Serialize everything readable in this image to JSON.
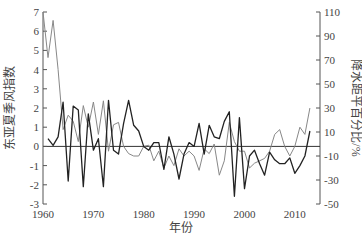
{
  "chart_data": {
    "type": "line",
    "title": "",
    "xlabel": "年份",
    "ylabel_left": "东亚夏季风指数",
    "ylabel_right": "降水距平百分比/%",
    "x_ticks": [
      "1960",
      "1970",
      "1980",
      "1990",
      "2000",
      "2010"
    ],
    "y_left_ticks": [
      "7",
      "6",
      "5",
      "4",
      "3",
      "2",
      "1",
      "0",
      "-1",
      "-2",
      "-3"
    ],
    "y_right_ticks": [
      "110",
      "90",
      "70",
      "50",
      "30",
      "10",
      "-10",
      "-30",
      "-50"
    ],
    "ylim_left": [
      -3,
      7
    ],
    "ylim_right": [
      -50,
      110
    ],
    "xlim": [
      1960,
      2015
    ],
    "grid": false,
    "legend": "none",
    "zero_line": true,
    "series": [
      {
        "name": "东亚夏季风指数",
        "axis": "left",
        "color": "#222222",
        "x": [
          1961,
          1962,
          1963,
          1964,
          1965,
          1966,
          1967,
          1968,
          1969,
          1970,
          1971,
          1972,
          1973,
          1974,
          1975,
          1976,
          1977,
          1978,
          1979,
          1980,
          1981,
          1982,
          1983,
          1984,
          1985,
          1986,
          1987,
          1988,
          1989,
          1990,
          1991,
          1992,
          1993,
          1994,
          1995,
          1996,
          1997,
          1998,
          1999,
          2000,
          2001,
          2002,
          2003,
          2004,
          2005,
          2006,
          2007,
          2008,
          2009,
          2010,
          2011,
          2012,
          2013
        ],
        "values": [
          0.4,
          0.05,
          0.5,
          2.3,
          -1.8,
          2.1,
          1.9,
          -2.1,
          1.7,
          -0.2,
          0.4,
          -2.1,
          2.4,
          -0.2,
          -0.4,
          1.2,
          2.4,
          1.1,
          0.8,
          0.0,
          -0.2,
          0.2,
          0.2,
          -1.2,
          0.5,
          -0.4,
          -1.7,
          -0.4,
          0.2,
          0.0,
          1.2,
          -0.4,
          1.1,
          0.5,
          0.4,
          1.3,
          1.8,
          -2.6,
          1.5,
          -2.2,
          -0.5,
          -0.2,
          -0.9,
          -1.5,
          -0.3,
          -0.7,
          -0.9,
          -0.9,
          -0.6,
          -1.4,
          -1.0,
          -0.5,
          0.8
        ]
      },
      {
        "name": "降水距平百分比",
        "axis": "right",
        "color": "#888888",
        "x": [
          1960,
          1961,
          1962,
          1963,
          1964,
          1965,
          1966,
          1967,
          1968,
          1969,
          1970,
          1971,
          1972,
          1973,
          1974,
          1975,
          1976,
          1977,
          1978,
          1979,
          1980,
          1981,
          1982,
          1983,
          1984,
          1985,
          1986,
          1987,
          1988,
          1989,
          1990,
          1991,
          1992,
          1993,
          1994,
          1995,
          1996,
          1997,
          1998,
          1999,
          2000,
          2001,
          2002,
          2003,
          2004,
          2005,
          2006,
          2007,
          2008,
          2009,
          2010,
          2011,
          2012,
          2013
        ],
        "values": [
          110,
          72,
          103,
          62,
          12,
          24,
          19,
          2,
          32,
          14,
          35,
          8,
          36,
          -6,
          16,
          18,
          -2,
          -8,
          -10,
          -10,
          -2,
          -1,
          -14,
          -6,
          -20,
          -10,
          -18,
          -4,
          -10,
          -6,
          -10,
          -22,
          -4,
          -8,
          0,
          -26,
          -14,
          18,
          2,
          -6,
          -6,
          -20,
          -16,
          -14,
          -12,
          -6,
          8,
          12,
          -2,
          -10,
          -2,
          14,
          8,
          30
        ]
      }
    ]
  },
  "labels": {
    "xlabel": "年份",
    "ylabel_left": "东亚夏季风指数",
    "ylabel_right": "降水距平百分比/%"
  }
}
